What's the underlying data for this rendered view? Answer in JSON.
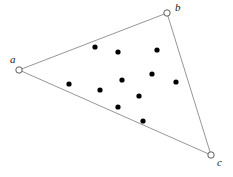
{
  "figure": {
    "width": 233,
    "height": 177,
    "background_color": "#ffffff",
    "edge_color": "#8a8a8a",
    "vertex_stroke_color": "#4a4a4a",
    "vertex_fill_color": "#ffffff",
    "dot_color": "#000000",
    "vertex_radius": 3.2,
    "dot_radius": 2.6,
    "vertices": [
      {
        "id": "a",
        "label": "a",
        "x": 19,
        "y": 70,
        "label_x": 10,
        "label_y": 54
      },
      {
        "id": "b",
        "label": "b",
        "x": 167,
        "y": 13,
        "label_x": 175,
        "label_y": 2
      },
      {
        "id": "c",
        "label": "c",
        "x": 211,
        "y": 155,
        "label_x": 217,
        "label_y": 157
      }
    ],
    "edges": [
      {
        "id": "edge-ab",
        "from": "a",
        "to": "b"
      },
      {
        "id": "edge-bc",
        "from": "b",
        "to": "c"
      },
      {
        "id": "edge-ca",
        "from": "c",
        "to": "a"
      }
    ],
    "interior_points": [
      {
        "x": 95,
        "y": 47
      },
      {
        "x": 118,
        "y": 52
      },
      {
        "x": 157,
        "y": 50
      },
      {
        "x": 122,
        "y": 80
      },
      {
        "x": 152,
        "y": 74
      },
      {
        "x": 176,
        "y": 82
      },
      {
        "x": 69,
        "y": 84
      },
      {
        "x": 100,
        "y": 90
      },
      {
        "x": 139,
        "y": 96
      },
      {
        "x": 118,
        "y": 107
      },
      {
        "x": 143,
        "y": 121
      }
    ],
    "interior_point_count": 11
  }
}
